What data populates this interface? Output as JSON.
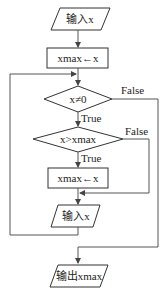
{
  "nodes": {
    "input1": {
      "label": "输入x",
      "type": "parallelogram"
    },
    "init": {
      "label": "xmax←x",
      "type": "rectangle"
    },
    "cond1": {
      "label": "x≠0",
      "type": "diamond"
    },
    "cond2": {
      "label": "x>xmax",
      "type": "diamond"
    },
    "assign": {
      "label": "xmax←x",
      "type": "rectangle"
    },
    "input2": {
      "label": "输入x",
      "type": "parallelogram"
    },
    "output": {
      "label": "输出xmax",
      "type": "parallelogram"
    }
  },
  "edges": {
    "cond1_true": "True",
    "cond1_false": "False",
    "cond2_true": "True",
    "cond2_false": "False"
  },
  "colors": {
    "stroke": "#333333",
    "background": "#ffffff"
  }
}
